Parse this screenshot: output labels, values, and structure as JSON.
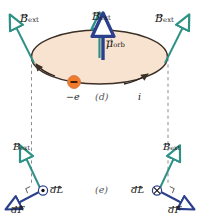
{
  "figure": {
    "panels": [
      {
        "id": "d",
        "label": "(d)"
      },
      {
        "id": "e",
        "label": "(e)"
      }
    ],
    "symbols": {
      "B_ext": "B",
      "B_ext_sub": "ext",
      "mu_orb": "μ",
      "mu_orb_sub": "orb",
      "electron_charge": "−e",
      "current": "i",
      "dL": "dL",
      "dF": "dF",
      "minus_sign": "−"
    },
    "colors": {
      "field_arrow": "#2e9186",
      "moment_arrow": "#2b3f8c",
      "force_arrow": "#2b3f8c",
      "disk_fill": "#f7e3cf",
      "disk_edge": "#3b2f26",
      "electron_fill": "#f07a2a",
      "dashed_line": "#8c8c8c",
      "text": "#1a1a1a"
    },
    "top_panel": {
      "field_arrows": [
        {
          "name": "b-ext-top-left",
          "label": "B",
          "sub": "ext"
        },
        {
          "name": "b-ext-top-center",
          "label": "B",
          "sub": "ext"
        },
        {
          "name": "b-ext-top-right",
          "label": "B",
          "sub": "ext"
        }
      ],
      "moment_arrow": {
        "name": "mu-orb",
        "label": "μ",
        "sub": "orb"
      },
      "orbit_labels": {
        "charge": "−e",
        "panel": "(d)",
        "current": "i"
      }
    },
    "bottom_left": {
      "b_label": "B",
      "b_sub": "ext",
      "dl_label": "dL",
      "dl_direction": "out-of-page",
      "df_label": "dF"
    },
    "bottom_right": {
      "b_label": "B",
      "b_sub": "ext",
      "dl_label": "dL",
      "dl_direction": "into-page",
      "df_label": "dF"
    },
    "bottom_panel_label": "(e)"
  }
}
